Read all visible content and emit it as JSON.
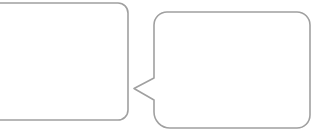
{
  "canvas": {
    "width": 324,
    "height": 139,
    "background_color": "#ffffff"
  },
  "graphic": {
    "description": "two-empty-speech-bubbles-facing-each-other",
    "stroke_color": "#a0a0a0",
    "stroke_width": 1.6,
    "fill_color": "#ffffff",
    "left_bubble": {
      "type": "rounded-rect-clipped-at-left-edge",
      "x": -24,
      "y": 3,
      "width": 152,
      "height": 117,
      "corner_radius": 10
    },
    "right_bubble": {
      "type": "rounded-rect-with-left-tail",
      "x": 154,
      "y": 12,
      "right": 310,
      "bottom": 128,
      "corner_radius": 13,
      "bottom_left_corner_radius": 16,
      "tail_tip_x": 134,
      "tail_tip_y": 88.5,
      "tail_top_y": 78,
      "tail_bottom_y": 100
    }
  }
}
